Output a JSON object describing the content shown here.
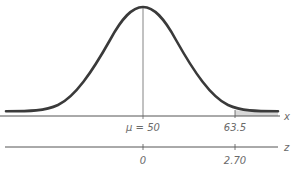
{
  "diagram": {
    "type": "normal-distribution",
    "x_axis": {
      "name": "x",
      "ticks": [
        {
          "value": 50,
          "label": "μ = 50"
        },
        {
          "value": 63.5,
          "label": "63.5"
        }
      ]
    },
    "z_axis": {
      "name": "z",
      "ticks": [
        {
          "value": 0,
          "label": "0"
        },
        {
          "value": 2.7,
          "label": "2.70"
        }
      ]
    },
    "shaded_region": "right tail beyond x = 63.5 (z = 2.70)",
    "colors": {
      "curve": "#3a3a3a",
      "axis": "#555555",
      "shade": "#d8d8d8",
      "label": "#6a6a6a"
    }
  },
  "labels": {
    "x_axis_name": "x",
    "z_axis_name": "z",
    "mu_label": "μ = 50",
    "x_tick_2": "63.5",
    "z_tick_1": "0",
    "z_tick_2": "2.70"
  }
}
